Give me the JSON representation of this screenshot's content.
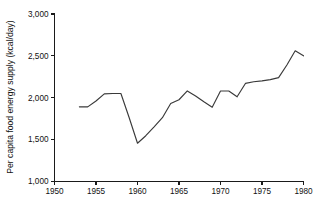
{
  "chart_data": {
    "type": "line",
    "title": "",
    "subtitle": "",
    "xlabel": "",
    "ylabel": "Per capita food energy supply (kcal/day)",
    "xlim": [
      1950,
      1980
    ],
    "ylim": [
      1000,
      3000
    ],
    "grid": false,
    "legend": null,
    "legend_position": "none",
    "x_ticks": [
      1950,
      1955,
      1960,
      1965,
      1970,
      1975,
      1980
    ],
    "x_tick_labels": [
      "1950",
      "1955",
      "1960",
      "1965",
      "1970",
      "1975",
      "1980"
    ],
    "y_ticks": [
      1000,
      1500,
      2000,
      2500,
      3000
    ],
    "y_tick_labels": [
      "1,000",
      "1,500",
      "2,000",
      "2,500",
      "3,000"
    ],
    "line_color": "#3a3a3a",
    "axis_color": "#1a1a1a",
    "background_color": "#ffffff",
    "series": [
      {
        "name": "Per capita food energy supply",
        "x": [
          1953,
          1954,
          1955,
          1956,
          1957,
          1958,
          1959,
          1960,
          1961,
          1962,
          1963,
          1964,
          1965,
          1966,
          1967,
          1968,
          1969,
          1970,
          1971,
          1972,
          1973,
          1974,
          1975,
          1976,
          1977,
          1978,
          1979,
          1980
        ],
        "values": [
          1890,
          1890,
          1960,
          2045,
          2050,
          2050,
          1760,
          1455,
          1545,
          1650,
          1760,
          1930,
          1975,
          2080,
          2020,
          1950,
          1885,
          2080,
          2080,
          2010,
          2170,
          2190,
          2200,
          2215,
          2240,
          2390,
          2560,
          2500
        ]
      }
    ],
    "annotations": []
  }
}
